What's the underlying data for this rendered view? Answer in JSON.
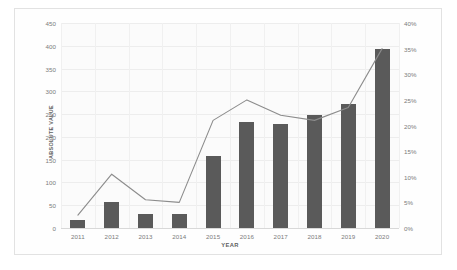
{
  "chart_data": {
    "type": "bar",
    "title": "",
    "subtitle": "",
    "xlabel": "YEAR",
    "ylabel": "ABSOLUTE VALUE",
    "y2label": "% OVER THE TOTAL OF NOTIFICATIONS",
    "categories": [
      "2011",
      "2012",
      "2013",
      "2014",
      "2015",
      "2016",
      "2017",
      "2018",
      "2019",
      "2020"
    ],
    "ylim": [
      0,
      450
    ],
    "y2lim": [
      0,
      40
    ],
    "yticks": [
      "0",
      "50",
      "100",
      "150",
      "200",
      "250",
      "300",
      "350",
      "400",
      "450"
    ],
    "ytick_values": [
      0,
      50,
      100,
      150,
      200,
      250,
      300,
      350,
      400,
      450
    ],
    "y2ticks": [
      "0%",
      "5%",
      "10%",
      "15%",
      "20%",
      "25%",
      "30%",
      "35%",
      "40%"
    ],
    "y2tick_values": [
      0,
      5,
      10,
      15,
      20,
      25,
      30,
      35,
      40
    ],
    "grid": true,
    "legend": "none",
    "series": [
      {
        "name": "ABSOLUTE VALUE",
        "type": "bar",
        "axis": "left",
        "color": "#5a5a5a",
        "values": [
          18,
          57,
          30,
          30,
          158,
          232,
          228,
          248,
          272,
          394
        ]
      },
      {
        "name": "% OVER THE TOTAL OF NOTIFICATIONS",
        "type": "line",
        "axis": "right",
        "color": "#8c8c8c",
        "values": [
          2.5,
          10.5,
          5.5,
          5.0,
          21.0,
          25.0,
          22.0,
          21.0,
          23.5,
          35.0
        ]
      }
    ]
  },
  "colors": {
    "bar": "#5a5a5a",
    "line": "#8c8c8c",
    "grid": "#ededed",
    "axis_text": "#7b7b7b",
    "label_text": "#5f5f5f",
    "card_border": "#e2e2e2",
    "plot_background": "#fbfbfb"
  }
}
